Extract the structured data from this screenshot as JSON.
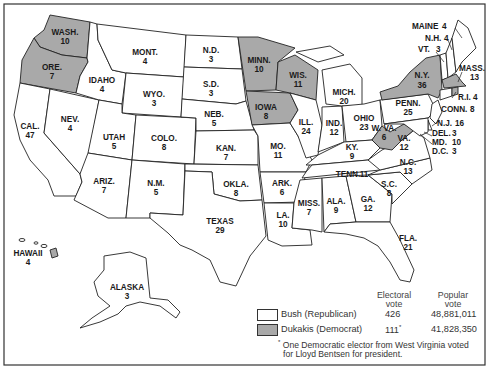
{
  "map": {
    "title": "1988 U.S. Presidential Election — Electoral Votes by State",
    "colors": {
      "republican_fill": "#ffffff",
      "democrat_fill": "#a9a9a9",
      "border": "#222222"
    },
    "states": [
      {
        "id": "wa",
        "label": "WASH.",
        "votes": "10",
        "party": "dem"
      },
      {
        "id": "or",
        "label": "ORE.",
        "votes": "7",
        "party": "dem"
      },
      {
        "id": "ca",
        "label": "CAL.",
        "votes": "47",
        "party": "rep"
      },
      {
        "id": "id",
        "label": "IDAHO",
        "votes": "4",
        "party": "rep"
      },
      {
        "id": "nv",
        "label": "NEV.",
        "votes": "4",
        "party": "rep"
      },
      {
        "id": "mt",
        "label": "MONT.",
        "votes": "4",
        "party": "rep"
      },
      {
        "id": "wy",
        "label": "WYO.",
        "votes": "3",
        "party": "rep"
      },
      {
        "id": "ut",
        "label": "UTAH",
        "votes": "5",
        "party": "rep"
      },
      {
        "id": "co",
        "label": "COLO.",
        "votes": "8",
        "party": "rep"
      },
      {
        "id": "az",
        "label": "ARIZ.",
        "votes": "7",
        "party": "rep"
      },
      {
        "id": "nm",
        "label": "N.M.",
        "votes": "5",
        "party": "rep"
      },
      {
        "id": "nd",
        "label": "N.D.",
        "votes": "3",
        "party": "rep"
      },
      {
        "id": "sd",
        "label": "S.D.",
        "votes": "3",
        "party": "rep"
      },
      {
        "id": "ne",
        "label": "NEB.",
        "votes": "5",
        "party": "rep"
      },
      {
        "id": "ks",
        "label": "KAN.",
        "votes": "7",
        "party": "rep"
      },
      {
        "id": "ok",
        "label": "OKLA.",
        "votes": "8",
        "party": "rep"
      },
      {
        "id": "tx",
        "label": "TEXAS",
        "votes": "29",
        "party": "rep"
      },
      {
        "id": "mn",
        "label": "MINN.",
        "votes": "10",
        "party": "dem"
      },
      {
        "id": "ia",
        "label": "IOWA",
        "votes": "8",
        "party": "dem"
      },
      {
        "id": "mo",
        "label": "MO.",
        "votes": "11",
        "party": "rep"
      },
      {
        "id": "ar",
        "label": "ARK.",
        "votes": "6",
        "party": "rep"
      },
      {
        "id": "la",
        "label": "LA.",
        "votes": "10",
        "party": "rep"
      },
      {
        "id": "wi",
        "label": "WIS.",
        "votes": "11",
        "party": "dem"
      },
      {
        "id": "il",
        "label": "ILL.",
        "votes": "24",
        "party": "rep"
      },
      {
        "id": "mi",
        "label": "MICH.",
        "votes": "20",
        "party": "rep"
      },
      {
        "id": "in",
        "label": "IND.",
        "votes": "12",
        "party": "rep"
      },
      {
        "id": "oh",
        "label": "OHIO",
        "votes": "23",
        "party": "rep"
      },
      {
        "id": "ky",
        "label": "KY.",
        "votes": "9",
        "party": "rep"
      },
      {
        "id": "tn",
        "label": "TENN.",
        "votes": "11",
        "party": "rep"
      },
      {
        "id": "ms",
        "label": "MISS.",
        "votes": "7",
        "party": "rep"
      },
      {
        "id": "al",
        "label": "ALA.",
        "votes": "9",
        "party": "rep"
      },
      {
        "id": "ga",
        "label": "GA.",
        "votes": "12",
        "party": "rep"
      },
      {
        "id": "fl",
        "label": "FLA.",
        "votes": "21",
        "party": "rep"
      },
      {
        "id": "sc",
        "label": "S.C.",
        "votes": "8",
        "party": "rep"
      },
      {
        "id": "nc",
        "label": "N.C.",
        "votes": "13",
        "party": "rep"
      },
      {
        "id": "va",
        "label": "VA.",
        "votes": "12",
        "party": "rep"
      },
      {
        "id": "wv",
        "label": "W. VA.",
        "votes": "6",
        "party": "dem"
      },
      {
        "id": "pa",
        "label": "PENN.",
        "votes": "25",
        "party": "rep"
      },
      {
        "id": "ny",
        "label": "N.Y.",
        "votes": "36",
        "party": "dem"
      },
      {
        "id": "vt",
        "label": "VT.",
        "votes": "3",
        "party": "rep"
      },
      {
        "id": "nh",
        "label": "N.H.",
        "votes": "4",
        "party": "rep"
      },
      {
        "id": "me",
        "label": "MAINE",
        "votes": "4",
        "party": "rep"
      },
      {
        "id": "ma",
        "label": "MASS.",
        "votes": "13",
        "party": "dem"
      },
      {
        "id": "ri",
        "label": "R.I.",
        "votes": "4",
        "party": "dem"
      },
      {
        "id": "ct",
        "label": "CONN.",
        "votes": "8",
        "party": "rep"
      },
      {
        "id": "nj",
        "label": "N.J.",
        "votes": "16",
        "party": "rep"
      },
      {
        "id": "de",
        "label": "DEL.",
        "votes": "3",
        "party": "rep"
      },
      {
        "id": "md",
        "label": "MD.",
        "votes": "10",
        "party": "rep"
      },
      {
        "id": "dc",
        "label": "D.C.",
        "votes": "3",
        "party": "rep"
      },
      {
        "id": "hi",
        "label": "HAWAII",
        "votes": "4",
        "party": "dem"
      },
      {
        "id": "ak",
        "label": "ALASKA",
        "votes": "3",
        "party": "rep"
      }
    ]
  },
  "legend": {
    "col_electoral": "Electoral\nvote",
    "col_electoral_l1": "Electoral",
    "col_electoral_l2": "vote",
    "col_popular_l1": "Popular",
    "col_popular_l2": "vote",
    "rows": [
      {
        "candidate": "Bush (Republican)",
        "electoral": "426",
        "popular": "48,881,011",
        "party": "rep"
      },
      {
        "candidate": "Dukakis (Democrat)",
        "electoral": "111",
        "electoral_mark": "*",
        "popular": "41,828,350",
        "party": "dem"
      }
    ],
    "footnote_mark": "*",
    "footnote_l1": "One Democratic elector from West Virginia voted",
    "footnote_l2": "for Lloyd Bentsen for president."
  }
}
